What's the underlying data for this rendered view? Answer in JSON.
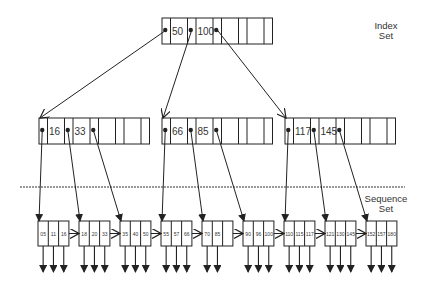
{
  "labels": {
    "index_set": [
      "Index",
      "Set"
    ],
    "sequence_set": [
      "Sequence",
      "Set"
    ]
  },
  "colors": {
    "line": "#222222",
    "text": "#333333",
    "background": "#ffffff"
  },
  "index_root": {
    "keys": [
      "50",
      "100"
    ],
    "slots": 4
  },
  "index_level2": [
    {
      "keys": [
        "16",
        "33"
      ],
      "slots": 4
    },
    {
      "keys": [
        "66",
        "85"
      ],
      "slots": 4
    },
    {
      "keys": [
        "117",
        "145"
      ],
      "slots": 4
    }
  ],
  "sequence_set": [
    {
      "keys": [
        "05",
        "11",
        "16"
      ]
    },
    {
      "keys": [
        "18",
        "20",
        "33"
      ]
    },
    {
      "keys": [
        "35",
        "40",
        "50"
      ]
    },
    {
      "keys": [
        "55",
        "57",
        "66"
      ]
    },
    {
      "keys": [
        "70",
        "85",
        ""
      ]
    },
    {
      "keys": [
        "90",
        "96",
        "100"
      ]
    },
    {
      "keys": [
        "110",
        "115",
        "117"
      ]
    },
    {
      "keys": [
        "121",
        "130",
        "145"
      ]
    },
    {
      "keys": [
        "152",
        "157",
        "180"
      ]
    }
  ]
}
